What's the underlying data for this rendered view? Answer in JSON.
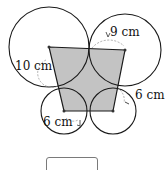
{
  "figure": {
    "shape_fill": "#c3c3c3",
    "stroke": "#1a1a1a",
    "circles": [
      {
        "id": "top-left",
        "cx": 49,
        "cy": 47,
        "r": 40,
        "label": "10 cm"
      },
      {
        "id": "top-right",
        "cx": 125,
        "cy": 50,
        "r": 36,
        "label": "9 cm"
      },
      {
        "id": "bottom-right",
        "cx": 113,
        "cy": 111,
        "r": 23,
        "label": "6 cm"
      },
      {
        "id": "bottom-left",
        "cx": 64,
        "cy": 111,
        "r": 23,
        "label": "6 cm"
      }
    ],
    "labels": {
      "top_left": "10 cm",
      "top_right": "9 cm",
      "bottom_right": "6 cm",
      "bottom_left": "6 cm"
    }
  },
  "answer": {
    "value": ""
  }
}
